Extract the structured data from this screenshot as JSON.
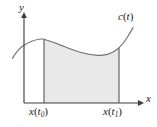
{
  "figure": {
    "type": "math-diagram",
    "background_color": "#ffffff",
    "axes": {
      "origin": {
        "x": 24,
        "y": 103
      },
      "x_axis": {
        "label": "x",
        "label_italic": true,
        "arrow": true,
        "start_x": 24,
        "end_x": 142,
        "y": 103,
        "color": "#3a3a3a"
      },
      "y_axis": {
        "label": "y",
        "label_italic": true,
        "arrow": true,
        "x": 24,
        "start_y": 103,
        "end_y": 14,
        "color": "#3a3a3a"
      }
    },
    "curve": {
      "name": "c(t)",
      "label_base": "c",
      "label_open_paren": "(",
      "label_arg": "t",
      "label_close_paren": ")",
      "color": "#6e6e6e",
      "stroke_width": 1.1,
      "points": [
        {
          "x": 13,
          "y": 58
        },
        {
          "x": 20,
          "y": 48
        },
        {
          "x": 28,
          "y": 43
        },
        {
          "x": 36,
          "y": 40
        },
        {
          "x": 44,
          "y": 39
        },
        {
          "x": 56,
          "y": 43
        },
        {
          "x": 68,
          "y": 48
        },
        {
          "x": 80,
          "y": 52
        },
        {
          "x": 92,
          "y": 55
        },
        {
          "x": 103,
          "y": 55
        },
        {
          "x": 112,
          "y": 51
        },
        {
          "x": 120,
          "y": 44
        },
        {
          "x": 127,
          "y": 35
        },
        {
          "x": 133,
          "y": 28
        }
      ]
    },
    "shaded_region": {
      "fill_color": "#e9e9e9",
      "edge_color": "#6a6a6a",
      "left_boundary_x": 44,
      "right_boundary_x": 119,
      "baseline_y": 103,
      "left_label": "x(t0)",
      "right_label": "x(t1)"
    },
    "tick_labels": {
      "left": {
        "base": "x",
        "open_paren": "(",
        "arg": "t",
        "sub": "0",
        "close_paren": ")"
      },
      "right": {
        "base": "x",
        "open_paren": "(",
        "arg": "t",
        "sub": "1",
        "close_paren": ")"
      }
    }
  }
}
